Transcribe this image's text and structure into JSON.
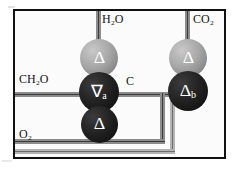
{
  "diagram": {
    "border_color": "#111111",
    "background_color": "#fbfbfb",
    "labels": [
      {
        "id": "h2o",
        "text": "H₂O",
        "x": 100,
        "y": 11
      },
      {
        "id": "co2",
        "text": "CO₂",
        "x": 193,
        "y": 11
      },
      {
        "id": "ch2o",
        "text": "CH₂O",
        "x": 17,
        "y": 71
      },
      {
        "id": "c",
        "text": "C",
        "x": 124,
        "y": 74
      },
      {
        "id": "o2",
        "text": "O₂",
        "x": 17,
        "y": 126
      }
    ],
    "nodes": [
      {
        "id": "node-top-left",
        "glyph": "Δ",
        "sub": "",
        "shade": "light",
        "x": 78,
        "y": 37,
        "size": 38
      },
      {
        "id": "node-middle-left",
        "glyph": "∇",
        "sub": "a",
        "shade": "dark",
        "x": 78,
        "y": 70,
        "size": 40
      },
      {
        "id": "node-bottom-left",
        "glyph": "Δ",
        "sub": "",
        "shade": "dark",
        "x": 80,
        "y": 104,
        "size": 37
      },
      {
        "id": "node-top-right",
        "glyph": "Δ",
        "sub": "",
        "shade": "light",
        "x": 167,
        "y": 37,
        "size": 38
      },
      {
        "id": "node-bottom-right",
        "glyph": "Δ",
        "sub": "b",
        "shade": "dark",
        "x": 166,
        "y": 69,
        "size": 40
      }
    ],
    "pipe_colors": {
      "outer": "#8c8c8c",
      "inner": "#3a3a3a",
      "outer_light": "#b4b4b4",
      "inner_light": "#6d6d6d"
    }
  }
}
